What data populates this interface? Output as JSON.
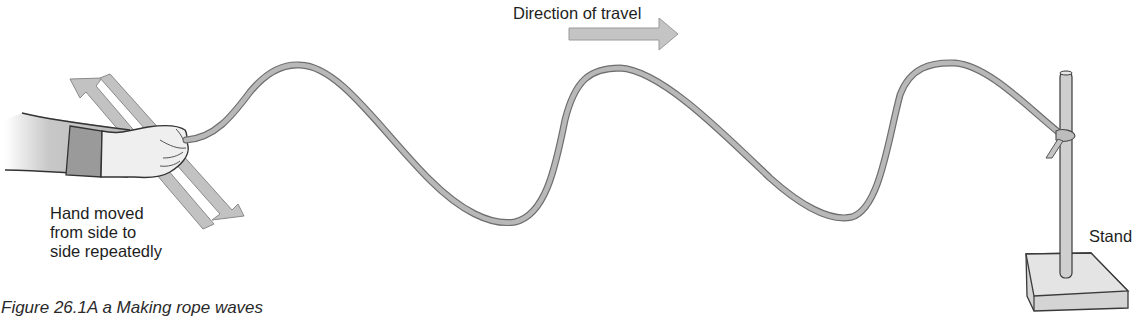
{
  "figure": {
    "caption": "Figure 26.1A a Making rope waves",
    "labels": {
      "hand": [
        "Hand moved",
        "from side to",
        "side repeatedly"
      ],
      "direction": "Direction of travel",
      "stand": "Stand"
    },
    "icons": {
      "hand": "hand-holding-rope-icon",
      "side_arrows": "double-diagonal-arrow-icon",
      "direction_arrow": "arrow-right-icon",
      "rope": "wave-rope-icon",
      "stand": "retort-stand-icon"
    },
    "colors": {
      "background": "#ffffff",
      "rope_fill": "#b4b4b4",
      "rope_edge": "#6e6e6e",
      "arrow_fill": "#c2c2c2",
      "arrow_edge": "#8a8a8a",
      "sleeve": "#9a9a9a",
      "skin": "#ececec",
      "text": "#1e1e1e"
    }
  }
}
